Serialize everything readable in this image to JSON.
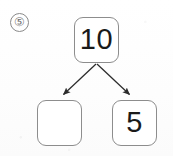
{
  "worksheet": {
    "problem_number": "⑤",
    "problem_number_plain": "5",
    "type": "number-bond"
  },
  "colors": {
    "page_background": "#fdfdfd",
    "box_border": "#8d8d8d",
    "box_fill": "#ffffff",
    "digit": "#1a1a1a",
    "arrow": "#2b2b2b",
    "problem_number": "#6f6f6f"
  },
  "number_bond": {
    "total": {
      "label": "10",
      "filled": true
    },
    "parts": [
      {
        "label": "",
        "filled": false,
        "position": "left"
      },
      {
        "label": "5",
        "filled": true,
        "position": "right"
      }
    ]
  },
  "arrows": [
    {
      "name": "arrow-to-left-part",
      "from": [
        96,
        64
      ],
      "to": [
        62,
        96
      ]
    },
    {
      "name": "arrow-to-right-part",
      "from": [
        97,
        64
      ],
      "to": [
        131,
        96
      ]
    }
  ]
}
